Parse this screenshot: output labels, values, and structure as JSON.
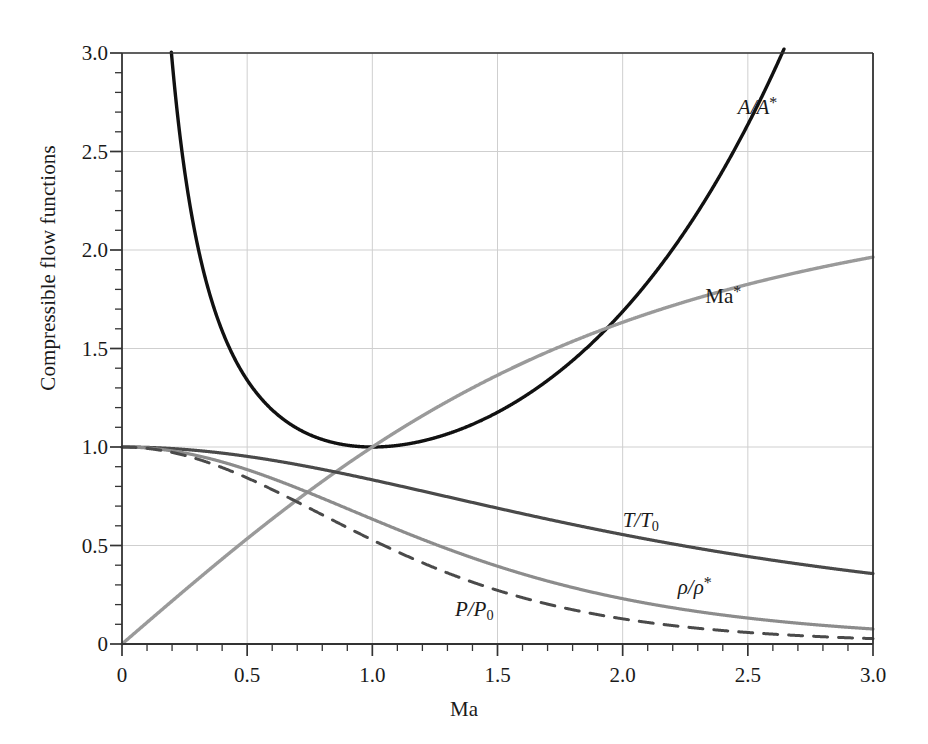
{
  "chart_data": {
    "type": "line",
    "title": "",
    "xlabel": "Ma",
    "ylabel": "Compressible flow functions",
    "xlim": [
      0,
      3.0
    ],
    "ylim": [
      0,
      3.0
    ],
    "xticks": [
      "0",
      "0.5",
      "1.0",
      "1.5",
      "2.0",
      "2.5",
      "3.0"
    ],
    "xtick_values": [
      0,
      0.5,
      1.0,
      1.5,
      2.0,
      2.5,
      3.0
    ],
    "yticks": [
      "0",
      "0.5",
      "1.0",
      "1.5",
      "2.0",
      "2.5",
      "3.0"
    ],
    "ytick_values": [
      0,
      0.5,
      1.0,
      1.5,
      2.0,
      2.5,
      3.0
    ],
    "minor_tick_step": 0.1,
    "grid": "major gridlines, light gray, both axes",
    "legend": "inline curve annotations",
    "gamma": 1.4,
    "colors": {
      "area_ratio": "#111111",
      "mach_star": "#9a9a9a",
      "temperature_ratio": "#4a4a4a",
      "density_ratio": "#8c8c8c",
      "pressure_ratio": "#4a4a4a",
      "grid": "#cfcfcf",
      "axis": "#333333"
    },
    "x": [
      0,
      0.1,
      0.2,
      0.3,
      0.4,
      0.5,
      0.6,
      0.7,
      0.8,
      0.9,
      1.0,
      1.1,
      1.2,
      1.3,
      1.4,
      1.5,
      1.6,
      1.7,
      1.8,
      1.9,
      2.0,
      2.1,
      2.2,
      2.3,
      2.4,
      2.5,
      2.6,
      2.7,
      2.8,
      2.9,
      3.0
    ],
    "series": [
      {
        "name": "A/A*",
        "label": "A/A*",
        "style": "solid",
        "color": "#111111",
        "width": 3.4,
        "values": [
          null,
          5.822,
          2.964,
          2.035,
          1.59,
          1.34,
          1.188,
          1.094,
          1.038,
          1.009,
          1.0,
          1.008,
          1.03,
          1.066,
          1.115,
          1.176,
          1.25,
          1.338,
          1.439,
          1.555,
          1.688,
          1.837,
          2.005,
          2.193,
          2.403,
          2.637,
          2.896,
          3.183,
          3.5,
          3.85,
          4.235
        ],
        "label_pos": {
          "x": 2.46,
          "y": 2.72
        },
        "note": "isentropic area ratio, enters frame top at Ma = 0.195 and exits top at Ma = 2.63"
      },
      {
        "name": "Ma*",
        "label": "Ma*",
        "style": "solid",
        "color": "#9a9a9a",
        "width": 3.4,
        "values": [
          0.0,
          0.1094,
          0.2182,
          0.3257,
          0.4313,
          0.5345,
          0.6348,
          0.7318,
          0.825,
          0.9143,
          1.0,
          1.0812,
          1.1583,
          1.2311,
          1.2999,
          1.3646,
          1.4254,
          1.4825,
          1.536,
          1.5861,
          1.633,
          1.6769,
          1.718,
          1.7563,
          1.7922,
          1.8257,
          1.857,
          1.8863,
          1.9137,
          1.9393,
          1.9633
        ],
        "label_pos": {
          "x": 2.33,
          "y": 1.76
        },
        "note": "critical Mach number, asymptote 2.449 at infinity; reaches ~1.96 at Ma=3"
      },
      {
        "name": "T/T0",
        "label": "T/T₀",
        "style": "solid",
        "color": "#4a4a4a",
        "width": 3.2,
        "values": [
          1.0,
          0.998,
          0.992,
          0.982,
          0.969,
          0.952,
          0.933,
          0.911,
          0.886,
          0.861,
          0.833,
          0.805,
          0.776,
          0.747,
          0.718,
          0.69,
          0.661,
          0.634,
          0.607,
          0.581,
          0.556,
          0.531,
          0.508,
          0.486,
          0.465,
          0.444,
          0.425,
          0.407,
          0.389,
          0.373,
          0.357
        ],
        "label_pos": {
          "x": 2.0,
          "y": 0.62
        },
        "note": "static/stagnation temperature ratio"
      },
      {
        "name": "rho/rho*",
        "label": "ρ/ρ*",
        "style": "solid",
        "color": "#8c8c8c",
        "width": 3.2,
        "values": [
          1.0,
          0.995,
          0.98,
          0.956,
          0.924,
          0.885,
          0.84,
          0.792,
          0.74,
          0.687,
          0.634,
          0.582,
          0.531,
          0.483,
          0.437,
          0.395,
          0.356,
          0.32,
          0.287,
          0.257,
          0.23,
          0.206,
          0.184,
          0.165,
          0.147,
          0.132,
          0.118,
          0.106,
          0.095,
          0.085,
          0.076
        ],
        "label_pos": {
          "x": 2.22,
          "y": 0.285
        },
        "note": "density ratio"
      },
      {
        "name": "P/P0",
        "label": "P/P₀",
        "style": "dashed",
        "color": "#4a4a4a",
        "width": 3.0,
        "dash": "14,11",
        "values": [
          1.0,
          0.993,
          0.972,
          0.939,
          0.896,
          0.843,
          0.784,
          0.721,
          0.656,
          0.591,
          0.528,
          0.468,
          0.412,
          0.361,
          0.314,
          0.272,
          0.235,
          0.203,
          0.174,
          0.149,
          0.128,
          0.109,
          0.094,
          0.08,
          0.068,
          0.059,
          0.05,
          0.043,
          0.037,
          0.032,
          0.027
        ],
        "label_pos": {
          "x": 1.33,
          "y": 0.165
        },
        "note": "static/stagnation pressure ratio"
      }
    ]
  },
  "axes": {
    "ylabel": "Compressible flow functions",
    "xlabel": "Ma",
    "xtick_labels": [
      "0",
      "0.5",
      "1.0",
      "1.5",
      "2.0",
      "2.5",
      "3.0"
    ],
    "ytick_labels": [
      "0",
      "0.5",
      "1.0",
      "1.5",
      "2.0",
      "2.5",
      "3.0"
    ]
  },
  "annotations": {
    "area_ratio": {
      "base": "A/A",
      "sup": "*"
    },
    "mach_star": {
      "base": "Ma",
      "sup": "*"
    },
    "temperature_ratio": {
      "base": "T/T",
      "sub": "0"
    },
    "density_ratio": {
      "base": "ρ/ρ",
      "sup": "*"
    },
    "pressure_ratio": {
      "base": "P/P",
      "sub": "0"
    }
  }
}
